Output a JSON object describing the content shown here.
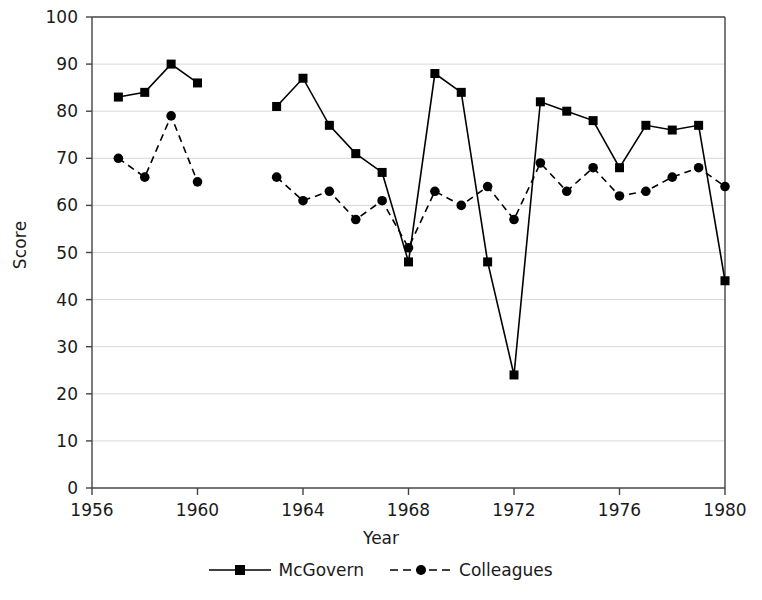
{
  "chart_data": {
    "type": "line",
    "title": "",
    "xlabel": "Year",
    "ylabel": "Score",
    "xlim": [
      1956,
      1980
    ],
    "ylim": [
      0,
      100
    ],
    "xticks": [
      1956,
      1960,
      1964,
      1968,
      1972,
      1976,
      1980
    ],
    "yticks": [
      0,
      10,
      20,
      30,
      40,
      50,
      60,
      70,
      80,
      90,
      100
    ],
    "grid": true,
    "grid_axis": "y",
    "legend_position": "bottom",
    "series": [
      {
        "name": "McGovern",
        "line_style": "solid",
        "marker": "square",
        "color": "#000000",
        "segments": [
          {
            "x": [
              1957,
              1958,
              1959,
              1960
            ],
            "y": [
              83,
              84,
              90,
              86
            ]
          },
          {
            "x": [
              1963,
              1964,
              1965,
              1966,
              1967,
              1968,
              1969,
              1970,
              1971,
              1972,
              1973,
              1974,
              1975,
              1976,
              1977,
              1978,
              1979,
              1980
            ],
            "y": [
              81,
              87,
              77,
              71,
              67,
              48,
              88,
              84,
              48,
              24,
              82,
              80,
              78,
              68,
              77,
              76,
              77,
              44
            ]
          }
        ]
      },
      {
        "name": "Colleagues",
        "line_style": "dashed",
        "marker": "circle",
        "color": "#000000",
        "segments": [
          {
            "x": [
              1957,
              1958,
              1959,
              1960
            ],
            "y": [
              70,
              66,
              79,
              65
            ]
          },
          {
            "x": [
              1963,
              1964,
              1965,
              1966,
              1967,
              1968,
              1969,
              1970,
              1971,
              1972,
              1973,
              1974,
              1975,
              1976,
              1977,
              1978,
              1979,
              1980
            ],
            "y": [
              66,
              61,
              63,
              57,
              61,
              51,
              63,
              60,
              64,
              57,
              69,
              63,
              68,
              62,
              63,
              66,
              68,
              64
            ]
          }
        ]
      }
    ]
  },
  "axis": {
    "ylabel": "Score",
    "xlabel": "Year",
    "ytick_labels": [
      "0",
      "10",
      "20",
      "30",
      "40",
      "50",
      "60",
      "70",
      "80",
      "90",
      "100"
    ],
    "xtick_labels": [
      "1956",
      "1960",
      "1964",
      "1968",
      "1972",
      "1976",
      "1980"
    ]
  },
  "legend": {
    "entries": [
      {
        "label": "McGovern",
        "style": "solid-square"
      },
      {
        "label": "Colleagues",
        "style": "dashed-circle"
      }
    ]
  }
}
